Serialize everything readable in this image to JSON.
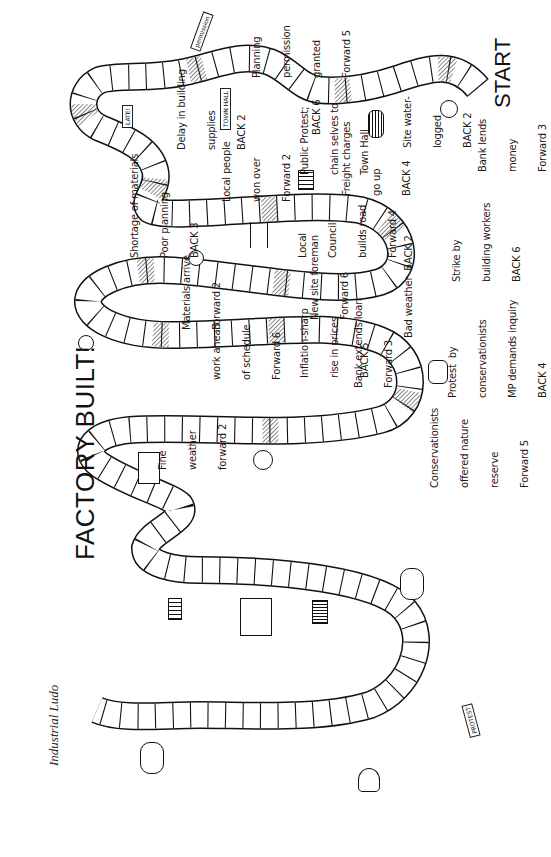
{
  "header": {
    "subtitle": "Industrial Ludo",
    "title": "FACTORY BUILT!"
  },
  "board": {
    "start_label": "START",
    "finish_label": "FACTORY BUILT!",
    "colors": {
      "line": "#111111",
      "hatch": "#333333",
      "background": "#ffffff"
    }
  },
  "events": [
    {
      "id": "planning",
      "lines": [
        "Planning",
        "permission",
        "granted",
        "Forward 5"
      ],
      "icon": "permission-sign-icon",
      "sign_text": "permission"
    },
    {
      "id": "bank-lends",
      "lines": [
        "Bank lends",
        "money",
        "Forward 3"
      ],
      "icon": "banker-icon"
    },
    {
      "id": "site-waterlogged",
      "lines": [
        "Site water-",
        "logged",
        "BACK 2"
      ],
      "icon": "rain-puddle-icon"
    },
    {
      "id": "public-protest",
      "lines": [
        "Public Protest;",
        "chain selves to",
        "Town Hall"
      ],
      "penalty": "BACK 6",
      "icon": "town-hall-icon",
      "sign_text": "TOWN HALL"
    },
    {
      "id": "delay-supplies",
      "lines": [
        "Delay in building",
        "supplies",
        "BACK 2"
      ],
      "icon": "late-notice-icon",
      "sign_text": "LATE!"
    },
    {
      "id": "freight",
      "lines": [
        "Freight charges",
        "go up",
        "BACK 4"
      ],
      "icon": "bricks-icon"
    },
    {
      "id": "local-people",
      "lines": [
        "Local people",
        "won over",
        "Forward 2"
      ],
      "icon": "person-with-sign-icon"
    },
    {
      "id": "shortage",
      "lines": [
        "Shortage of materials",
        "Poor planning",
        "BACK 3"
      ],
      "icon": "worried-man-icon"
    },
    {
      "id": "local-council",
      "lines": [
        "Local",
        "Council",
        "builds road",
        "Forward 4"
      ],
      "icon": "road-icon"
    },
    {
      "id": "strike",
      "lines": [
        "Strike by",
        "building workers",
        "BACK 6"
      ],
      "icon": "strikers-icon"
    },
    {
      "id": "materials-arrive",
      "lines": [
        "Materials arrive",
        "Forward 2"
      ],
      "icon": "truck-icon"
    },
    {
      "id": "new-foreman",
      "lines": [
        "New site foreman",
        "Forward 6"
      ],
      "icon": "foreman-icon"
    },
    {
      "id": "bad-weather",
      "lines": [
        "Bad weather  BACK 2"
      ],
      "icon": "rain-cloud-icon"
    },
    {
      "id": "work-ahead",
      "lines": [
        "work ahead",
        "of schedule",
        "Forward 6"
      ],
      "icon": "brick-wall-icon"
    },
    {
      "id": "inflation",
      "lines": [
        "Inflation-sharp",
        "rise in prices",
        "BACK 5"
      ],
      "icon": "price-chart-icon"
    },
    {
      "id": "bank-extends",
      "lines": [
        "Bank extends loan",
        "Forward 3"
      ],
      "icon": "banknotes-icon"
    },
    {
      "id": "protest-conservationists",
      "lines": [
        "Protest  by",
        "conservationists",
        "MP demands inquiry",
        "BACK 4"
      ],
      "icon": "protest-placard-icon",
      "sign_text": "PROTEST"
    },
    {
      "id": "conservationists",
      "lines": [
        "Conservationists",
        "offered nature",
        "reserve",
        "Forward 5"
      ],
      "icon": "tree-icon"
    },
    {
      "id": "fine-weather",
      "lines": [
        "Fine",
        "weather",
        "forward 2"
      ],
      "icon": "sun-cloud-icon"
    }
  ]
}
